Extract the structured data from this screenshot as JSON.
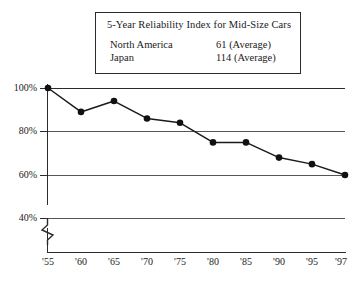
{
  "legend": {
    "title": "5-Year Reliability Index for Mid-Size Cars",
    "rows": [
      {
        "name": "North America",
        "value": "61 (Average)"
      },
      {
        "name": "Japan",
        "value": "114 (Average)"
      }
    ]
  },
  "axis": {
    "y_ticks": [
      "100%",
      "80%",
      "60%",
      "40%"
    ],
    "x_ticks": [
      "'55",
      "'60",
      "'65",
      "'70",
      "'75",
      "'80",
      "'85",
      "'90",
      "'95",
      "'97"
    ],
    "break_symbol": "axis-break-zigzag"
  },
  "colors": {
    "line": "#1a1a1a",
    "marker": "#111111",
    "grid": "#555555",
    "frame": "#2b2b2b",
    "background": "#ffffff"
  },
  "chart_data": {
    "type": "line",
    "title": "5-Year Reliability Index for Mid-Size Cars",
    "xlabel": "",
    "ylabel": "",
    "x": [
      "'55",
      "'60",
      "'65",
      "'70",
      "'75",
      "'80",
      "'85",
      "'90",
      "'95",
      "'97"
    ],
    "categories": [
      "'55",
      "'60",
      "'65",
      "'70",
      "'75",
      "'80",
      "'85",
      "'90",
      "'95",
      "'97"
    ],
    "values": [
      100,
      89,
      94,
      86,
      84,
      75,
      75,
      68,
      65,
      60
    ],
    "series": [
      {
        "name": "Reliability Index",
        "values": [
          100,
          89,
          94,
          86,
          84,
          75,
          75,
          68,
          65,
          60
        ]
      }
    ],
    "ylim": [
      40,
      100
    ],
    "ytick_values": [
      100,
      80,
      60,
      40
    ],
    "ytick_labels": [
      "100%",
      "80%",
      "60%",
      "40%"
    ],
    "y_axis_broken": true,
    "grid": true,
    "grid_axis": "y",
    "legend_position": "top-center-box",
    "markers": "filled-circle",
    "annotations": [
      "North America  61 (Average)",
      "Japan  114 (Average)"
    ]
  }
}
